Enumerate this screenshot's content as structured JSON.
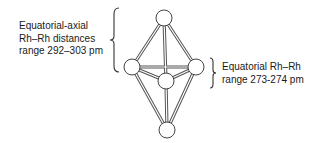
{
  "diagram": {
    "type": "octahedral Rh6 cluster",
    "atoms": [
      {
        "id": "top",
        "role": "axial",
        "x": 164,
        "y": 18
      },
      {
        "id": "left",
        "role": "equatorial",
        "x": 132,
        "y": 67
      },
      {
        "id": "right",
        "role": "equatorial",
        "x": 196,
        "y": 67
      },
      {
        "id": "front",
        "role": "equatorial",
        "x": 166,
        "y": 81
      },
      {
        "id": "bottom",
        "role": "axial",
        "x": 167,
        "y": 130
      }
    ],
    "annotations": {
      "equatorial_axial": {
        "line1": "Equatorial-axial",
        "line2": "Rh–Rh distances",
        "line3": "range 292–303 pm"
      },
      "equatorial": {
        "line1": "Equatorial Rh–Rh",
        "line2": "range 273-274 pm"
      }
    },
    "colors": {
      "stroke": "#444444",
      "atom_fill": "#ffffff",
      "text": "#1a1a1a"
    }
  }
}
